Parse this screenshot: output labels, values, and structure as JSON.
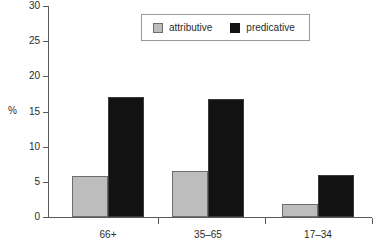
{
  "chart_data": {
    "type": "bar",
    "title": "",
    "subtitle": "",
    "xlabel": "",
    "ylabel": "%",
    "ylim": [
      0,
      30
    ],
    "yticks": [
      0,
      5,
      10,
      15,
      20,
      25,
      30
    ],
    "grid": false,
    "legend_position": "top-center",
    "categories": [
      "66+",
      "35–65",
      "17–34"
    ],
    "series": [
      {
        "name": "attributive",
        "color": "#bdbdbd",
        "values": [
          5.8,
          6.6,
          1.8
        ]
      },
      {
        "name": "predicative",
        "color": "#121212",
        "values": [
          17.0,
          16.8,
          6.0
        ]
      }
    ]
  },
  "legend": {
    "entries": [
      {
        "label": "attributive",
        "swatch": "legend-swatch-attributive"
      },
      {
        "label": "predicative",
        "swatch": "legend-swatch-predicative"
      }
    ]
  },
  "axes": {
    "y_unit_label": "%",
    "y_tick_labels": [
      "0",
      "5",
      "10",
      "15",
      "20",
      "25",
      "30"
    ],
    "x_tick_labels": [
      "66+",
      "35–65",
      "17–34"
    ]
  },
  "colors": {
    "attributive_fill": "#bdbdbd",
    "attributive_stroke": "#6d6d6d",
    "predicative_fill": "#121212",
    "axis": "#58595b",
    "text": "#2b2b2b",
    "legend_border": "#9a9a9a",
    "background": "#ffffff"
  }
}
